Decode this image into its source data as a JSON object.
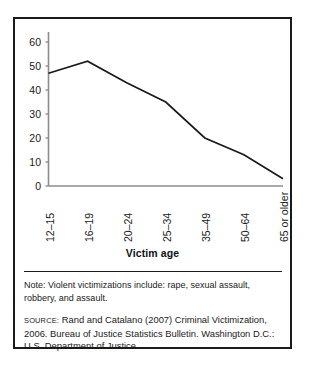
{
  "figure": {
    "axis_title": "Victim age",
    "note_label": "Note:",
    "note": "Note: Violent victimizations include: rape, sexual assault, robbery, and assault.",
    "source_label": "source:",
    "source": "Rand and Catalano (2007) Criminal Victimization, 2006. Bureau of Justice Statistics Bulletin. Washington D.C.: U.S. Department of Justice.",
    "line_color": "#1a1a1a",
    "axis_color": "#8c8c8c",
    "border_color": "#1a1a1a"
  },
  "chart_data": {
    "type": "line",
    "title": "",
    "subtitle": "",
    "xlabel": "Victim age",
    "ylabel": "",
    "categories": [
      "12–15",
      "16–19",
      "20–24",
      "25–34",
      "35–49",
      "50–64",
      "65 or older"
    ],
    "values": [
      47,
      52,
      43,
      35,
      20,
      13,
      3
    ],
    "ylim": [
      0,
      60
    ],
    "yticks": [
      0,
      10,
      20,
      30,
      40,
      50,
      60
    ],
    "ytick_labels": [
      "0",
      "10",
      "20",
      "30",
      "40",
      "50",
      "60"
    ],
    "grid": false,
    "legend": false,
    "legend_position": "none",
    "series": [
      {
        "name": "Rate of violent victimization",
        "values": [
          47,
          52,
          43,
          35,
          20,
          13,
          3
        ]
      }
    ]
  }
}
